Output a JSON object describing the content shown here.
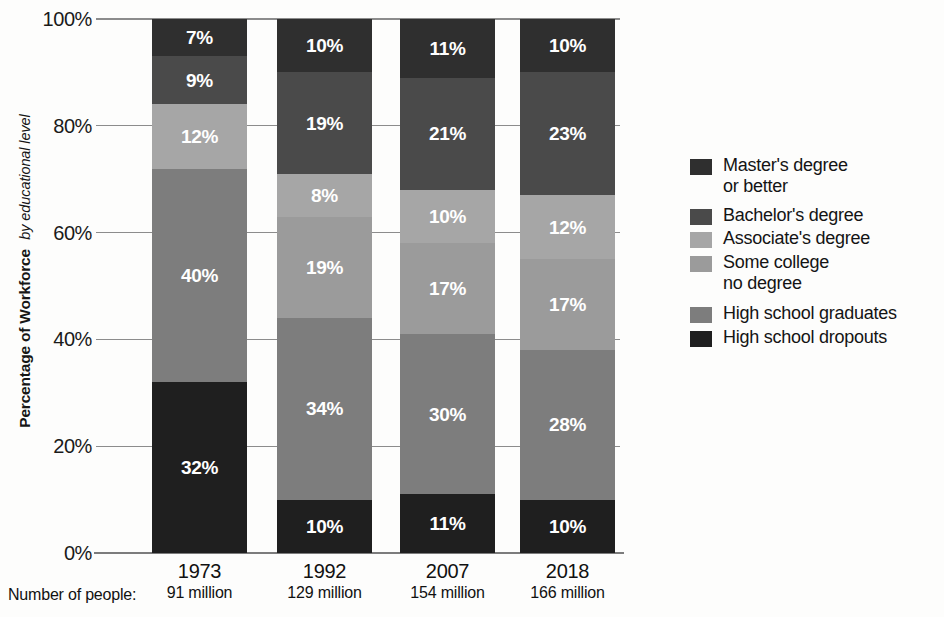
{
  "chart_data": {
    "type": "bar",
    "subtype": "stacked-bar-100",
    "title": "",
    "ylabel": "Percentage of Workforce",
    "ylabel_sub": "by educational level",
    "xlabel": "",
    "ylim": [
      0,
      100
    ],
    "grid": true,
    "legend_position": "right",
    "categories": [
      "1973",
      "1992",
      "2007",
      "2018"
    ],
    "category_sublabels": [
      "91 million",
      "129 million",
      "154 million",
      "166 million"
    ],
    "sublabel_caption": "Number of people:",
    "yticks": [
      "0%",
      "20%",
      "40%",
      "60%",
      "80%",
      "100%"
    ],
    "ytick_values": [
      0,
      20,
      40,
      60,
      80,
      100
    ],
    "series": [
      {
        "name": "Master's degree\nor better",
        "color": "#2f2f2f",
        "values": [
          7,
          10,
          11,
          10
        ],
        "labels": [
          "7%",
          "10%",
          "11%",
          "10%"
        ]
      },
      {
        "name": "Bachelor's degree",
        "color": "#4a4a4a",
        "values": [
          9,
          19,
          21,
          23
        ],
        "labels": [
          "9%",
          "19%",
          "21%",
          "23%"
        ]
      },
      {
        "name": "Associate's degree",
        "color": "#a6a6a6",
        "values": [
          12,
          8,
          10,
          12
        ],
        "labels": [
          "12%",
          "8%",
          "10%",
          "12%"
        ]
      },
      {
        "name": "Some college\nno degree",
        "color": "#9b9b9b",
        "values": [
          0,
          19,
          17,
          17
        ],
        "labels": [
          "",
          "19%",
          "17%",
          "17%"
        ]
      },
      {
        "name": "High school graduates",
        "color": "#7d7d7d",
        "values": [
          40,
          34,
          30,
          28
        ],
        "labels": [
          "40%",
          "34%",
          "30%",
          "28%"
        ]
      },
      {
        "name": "High school dropouts",
        "color": "#1f1f1f",
        "values": [
          32,
          10,
          11,
          10
        ],
        "labels": [
          "32%",
          "10%",
          "11%",
          "10%"
        ]
      }
    ]
  },
  "colors": {
    "gridline": "#8c8c8c",
    "text": "#141414",
    "label_text": "#ffffff",
    "background": "#fdfdfc"
  }
}
